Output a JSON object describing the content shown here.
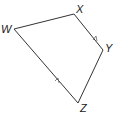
{
  "diagram": {
    "type": "quadrilateral",
    "vertices": [
      {
        "label": "W",
        "x": 14,
        "y": 29
      },
      {
        "label": "X",
        "x": 74,
        "y": 14
      },
      {
        "label": "Y",
        "x": 103,
        "y": 50
      },
      {
        "label": "Z",
        "x": 78,
        "y": 103
      }
    ],
    "parallel_marks": [
      "XY",
      "WZ"
    ],
    "stroke_color": "#333333"
  },
  "labels": {
    "w": "W",
    "x": "X",
    "y": "Y",
    "z": "Z"
  }
}
